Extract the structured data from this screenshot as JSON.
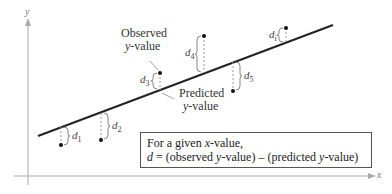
{
  "axes": {
    "x_label": "x",
    "y_label": "y"
  },
  "annotations": {
    "observed_line1": "Observed",
    "observed_line2_var": "y",
    "observed_line2_rest": "-value",
    "predicted_line1": "Predicted",
    "predicted_line2_var": "y",
    "predicted_line2_rest": "-value"
  },
  "distances": [
    {
      "label": "d",
      "sub": "1"
    },
    {
      "label": "d",
      "sub": "2"
    },
    {
      "label": "d",
      "sub": "3"
    },
    {
      "label": "d",
      "sub": "4"
    },
    {
      "label": "d",
      "sub": "5"
    },
    {
      "label": "d",
      "sub": "i"
    }
  ],
  "formula_box": {
    "line1_prefix": "For a given ",
    "line1_var": "x",
    "line1_suffix": "-value,",
    "line2_var": "d",
    "line2_rest_a": " = (observed ",
    "line2_var_y1": "y",
    "line2_rest_b": "-value) – (predicted ",
    "line2_var_y2": "y",
    "line2_rest_c": "-value)"
  },
  "colors": {
    "line": "#222222",
    "axis": "#999999",
    "dash": "#888888",
    "point": "#111111"
  }
}
